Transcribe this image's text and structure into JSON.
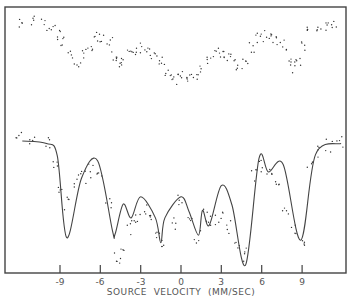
{
  "chart_data": {
    "type": "scatter",
    "title": "",
    "xlabel": "SOURCE  VELOCITY  (MM/SEC)",
    "ylabel": "",
    "xlim": [
      -13.4,
      12.0
    ],
    "x_ticks": [
      -9,
      -6,
      -3,
      0,
      3,
      6,
      9
    ],
    "x_tick_labels": [
      "-9",
      "-6",
      "-3",
      "0",
      "3",
      "6",
      "9"
    ],
    "grid": false,
    "legend": null,
    "series": [
      {
        "name": "upper spectrum (data points)",
        "style": "dots",
        "x": [
          -11.8,
          -11.0,
          -10.2,
          -9.6,
          -9.0,
          -8.7,
          -8.2,
          -7.7,
          -7.2,
          -6.8,
          -6.3,
          -5.8,
          -5.3,
          -4.9,
          -4.6,
          -4.3,
          -3.8,
          -3.3,
          -2.8,
          -2.3,
          -2.0,
          -1.6,
          -1.2,
          -0.8,
          -0.3,
          0.2,
          0.6,
          1.0,
          1.5,
          2.0,
          2.6,
          3.0,
          3.4,
          3.8,
          4.3,
          4.8,
          5.3,
          5.7,
          6.2,
          6.7,
          7.1,
          7.6,
          8.0,
          8.4,
          8.8,
          9.2,
          9.6,
          10.2,
          10.8,
          11.4
        ],
        "y": [
          0.96,
          0.97,
          0.94,
          0.9,
          0.86,
          0.8,
          0.66,
          0.58,
          0.68,
          0.76,
          0.82,
          0.84,
          0.8,
          0.66,
          0.6,
          0.58,
          0.66,
          0.72,
          0.73,
          0.71,
          0.68,
          0.64,
          0.54,
          0.48,
          0.46,
          0.47,
          0.48,
          0.46,
          0.52,
          0.6,
          0.68,
          0.7,
          0.67,
          0.64,
          0.56,
          0.62,
          0.74,
          0.82,
          0.84,
          0.82,
          0.78,
          0.76,
          0.66,
          0.56,
          0.6,
          0.76,
          0.88,
          0.92,
          0.93,
          0.94
        ]
      },
      {
        "name": "lower spectrum fit (solid line)",
        "style": "line",
        "x": [
          -11.8,
          -10.0,
          -9.2,
          -8.5,
          -7.4,
          -6.2,
          -5.1,
          -4.9,
          -4.3,
          -3.7,
          -3.0,
          -1.9,
          -1.5,
          -1.2,
          0.0,
          0.6,
          1.3,
          1.6,
          2.1,
          3.0,
          3.8,
          4.8,
          5.8,
          6.5,
          7.6,
          8.9,
          10.0,
          11.9
        ],
        "y": [
          1.0,
          0.98,
          0.88,
          0.22,
          0.7,
          0.84,
          0.28,
          0.25,
          0.49,
          0.38,
          0.55,
          0.38,
          0.18,
          0.38,
          0.55,
          0.43,
          0.24,
          0.44,
          0.32,
          0.64,
          0.48,
          0.0,
          0.86,
          0.75,
          0.81,
          0.2,
          0.89,
          0.98
        ]
      },
      {
        "name": "lower spectrum (data points)",
        "style": "dots",
        "x": [
          -12.0,
          -11.0,
          -10.0,
          -9.4,
          -8.9,
          -8.4,
          -7.8,
          -7.2,
          -6.6,
          -6.0,
          -5.4,
          -4.8,
          -4.4,
          -3.9,
          -3.4,
          -2.8,
          -2.2,
          -1.7,
          -1.2,
          -0.6,
          0.0,
          0.6,
          1.2,
          1.8,
          2.4,
          3.0,
          3.6,
          4.2,
          4.8,
          5.4,
          6.0,
          6.6,
          7.2,
          7.8,
          8.4,
          9.0,
          9.6,
          10.2,
          11.0,
          11.8
        ],
        "y": [
          1.02,
          1.01,
          0.98,
          0.82,
          0.62,
          0.5,
          0.68,
          0.7,
          0.76,
          0.74,
          0.48,
          0.06,
          0.1,
          0.3,
          0.38,
          0.44,
          0.36,
          0.22,
          0.16,
          0.34,
          0.52,
          0.4,
          0.22,
          0.4,
          0.36,
          0.38,
          0.3,
          0.14,
          0.08,
          0.72,
          0.8,
          0.76,
          0.7,
          0.42,
          0.28,
          0.16,
          0.82,
          0.92,
          0.96,
          0.98
        ]
      }
    ]
  },
  "axis": {
    "x_tick_labels": [
      "-9",
      "-6",
      "-3",
      "0",
      "3",
      "6",
      "9"
    ],
    "x_title": "SOURCE  VELOCITY  (MM/SEC)"
  }
}
